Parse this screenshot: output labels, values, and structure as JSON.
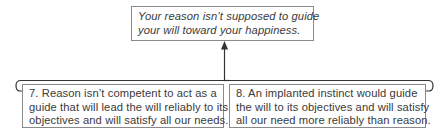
{
  "diagram": {
    "type": "argument-map",
    "conclusion": {
      "lines": [
        "Your reason isn’t supposed to guide",
        "your will toward your happiness."
      ],
      "style": "italic"
    },
    "premises": [
      {
        "number": "7",
        "lines": [
          "7. Reason isn’t competent to act as a",
          "guide that will lead the will reliably to its",
          "objectives and will satisfy all our needs."
        ]
      },
      {
        "number": "8",
        "lines": [
          "8. An implanted instinct would guide",
          "the will to its objectives and will satisfy",
          "all our need more reliably than reason."
        ]
      }
    ],
    "connector": {
      "kind": "bracket-with-arrow",
      "direction": "premises-to-conclusion"
    },
    "colors": {
      "text": "#3a3a3a",
      "border": "#8a8a8a",
      "line": "#333333",
      "background": "#ffffff"
    }
  }
}
